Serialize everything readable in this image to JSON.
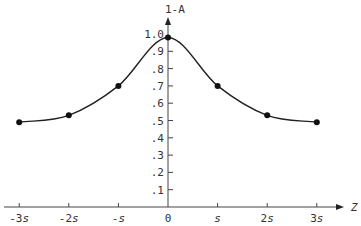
{
  "chart_data": {
    "type": "line",
    "title": "",
    "xlabel": "Z",
    "ylabel": "1-A",
    "x_tick_labels": [
      "-3s",
      "-2s",
      "-s",
      "0",
      "s",
      "2s",
      "3s"
    ],
    "x": [
      -3,
      -2,
      -1,
      0,
      1,
      2,
      3
    ],
    "y_tick_labels": [
      ".1",
      ".2",
      ".3",
      ".4",
      ".5",
      ".6",
      ".7",
      ".8",
      ".9",
      "1.0"
    ],
    "y_ticks": [
      0.1,
      0.2,
      0.3,
      0.4,
      0.5,
      0.6,
      0.7,
      0.8,
      0.9,
      1.0
    ],
    "series": [
      {
        "name": "1-A",
        "values": [
          0.49,
          0.53,
          0.7,
          0.98,
          0.7,
          0.53,
          0.49
        ],
        "markers": true,
        "smooth": true
      }
    ],
    "ylim": [
      0,
      1.05
    ],
    "xlim": [
      -3.3,
      3.4
    ],
    "grid": false,
    "legend": null
  }
}
